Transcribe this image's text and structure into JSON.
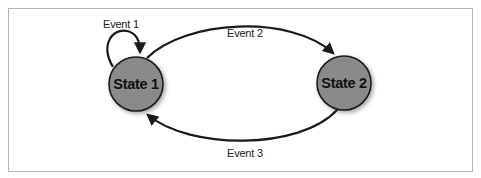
{
  "diagram": {
    "type": "state-machine",
    "states": [
      {
        "id": "state1",
        "label": "State 1"
      },
      {
        "id": "state2",
        "label": "State 2"
      }
    ],
    "transitions": [
      {
        "id": "event1",
        "label": "Event 1",
        "from": "state1",
        "to": "state1"
      },
      {
        "id": "event2",
        "label": "Event 2",
        "from": "state1",
        "to": "state2"
      },
      {
        "id": "event3",
        "label": "Event 3",
        "from": "state2",
        "to": "state1"
      }
    ],
    "colors": {
      "state_fill": "#8a8a8a",
      "stroke": "#1a1a1a",
      "frame": "#b5b5b5"
    }
  }
}
